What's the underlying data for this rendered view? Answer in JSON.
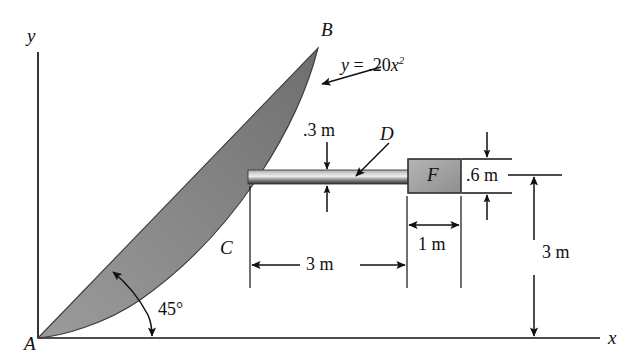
{
  "figure": {
    "background_color": "#ffffff",
    "line_color": "#111111",
    "shade_color": "#8a8a8a",
    "rod_color": "#6f6f6f",
    "block_color": "#9a9a9a"
  },
  "axes": {
    "x_label": "x",
    "y_label": "y"
  },
  "points": {
    "a": "A",
    "b": "B",
    "c": "C",
    "d": "D",
    "f": "F"
  },
  "equation": {
    "lhs": "y",
    "eq": "=",
    "coef": ".20",
    "var": "x",
    "exp": "2",
    "full": "y = .20x2"
  },
  "dimensions": {
    "rod_thickness": ".3 m",
    "block_height": ".6 m",
    "rod_span": "3 m",
    "block_width": "1 m",
    "height_above_axis": "3 m",
    "angle": "45°"
  }
}
